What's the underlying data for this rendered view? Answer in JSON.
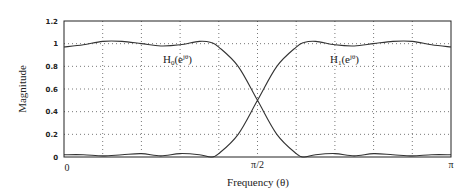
{
  "chart_data": {
    "type": "line",
    "title": "",
    "xlabel": "Frequency (θ)",
    "ylabel": "Magnitude",
    "xlim": [
      0,
      1
    ],
    "x_unit": "π radians",
    "ylim": [
      0,
      1.2
    ],
    "grid": true,
    "y_ticks": [
      "0",
      "0.2",
      "0.4",
      "0.6",
      "0.8",
      "1",
      "1.2"
    ],
    "y_tick_values": [
      0,
      0.2,
      0.4,
      0.6,
      0.8,
      1.0,
      1.2
    ],
    "x_ticks": [
      "0",
      "π/2",
      "π"
    ],
    "x_tick_values": [
      0,
      0.5,
      1.0
    ],
    "x_grid_divisions": 10,
    "series": [
      {
        "name": "H0(e^jθ)",
        "label_main": "H",
        "label_sub": "0",
        "label_arg": "(e",
        "label_sup": "jθ",
        "label_close": ")",
        "kind": "lowpass",
        "x": [
          0,
          0.05,
          0.1,
          0.15,
          0.2,
          0.25,
          0.3,
          0.35,
          0.38,
          0.4,
          0.45,
          0.5,
          0.55,
          0.6,
          0.62,
          0.65,
          0.7,
          0.75,
          0.8,
          0.85,
          0.9,
          0.95,
          1.0
        ],
        "values": [
          0.97,
          0.99,
          1.02,
          1.02,
          1.0,
          0.98,
          0.99,
          1.02,
          1.01,
          0.97,
          0.8,
          0.5,
          0.2,
          0.03,
          0.0,
          0.02,
          0.03,
          0.01,
          0.03,
          0.02,
          0.01,
          0.02,
          0.02
        ]
      },
      {
        "name": "H1(e^jθ)",
        "label_main": "H",
        "label_sub": "1",
        "label_arg": "(e",
        "label_sup": "jθ",
        "label_close": ")",
        "kind": "highpass",
        "x": [
          0,
          0.05,
          0.1,
          0.15,
          0.2,
          0.25,
          0.3,
          0.35,
          0.38,
          0.4,
          0.45,
          0.5,
          0.55,
          0.6,
          0.62,
          0.65,
          0.7,
          0.75,
          0.8,
          0.85,
          0.9,
          0.95,
          1.0
        ],
        "values": [
          0.02,
          0.02,
          0.01,
          0.02,
          0.03,
          0.01,
          0.03,
          0.02,
          0.0,
          0.03,
          0.2,
          0.5,
          0.8,
          0.97,
          1.01,
          1.02,
          0.99,
          0.98,
          1.0,
          1.02,
          1.02,
          0.99,
          0.97
        ]
      }
    ],
    "annotations": [
      {
        "text": "H0(e^jθ)",
        "x": 0.25,
        "y": 0.84
      },
      {
        "text": "H1(e^jθ)",
        "x": 0.69,
        "y": 0.84
      }
    ],
    "crossover": {
      "x": 0.5,
      "y": 0.5
    }
  }
}
